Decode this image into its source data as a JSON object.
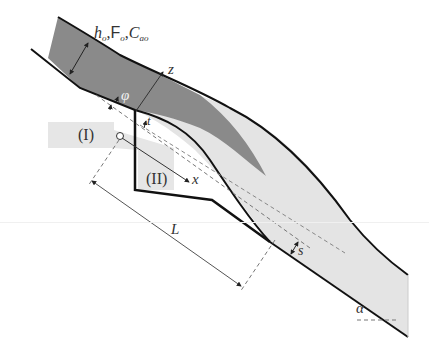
{
  "figure": {
    "type": "ski-jump spillway / aerator flow schematic",
    "colors": {
      "dark_core": "#8a8a8a",
      "light_flow": "#e4e4e4",
      "region_box": "#e8e8e8",
      "boundary": "#111111",
      "dimension": "#555555"
    }
  },
  "labels": {
    "inflow_h": "h",
    "inflow_h_sub": "o",
    "inflow_sep1": ",",
    "inflow_F": "F",
    "inflow_F_sub": "o",
    "inflow_sep2": ",",
    "inflow_C": "C",
    "inflow_C_sub": "ao",
    "z_axis": "z",
    "x_axis": "x",
    "phi": "φ",
    "t": "t",
    "region_1": "(I)",
    "region_2": "(II)",
    "length": "L",
    "step_s": "s",
    "angle_alpha": "α"
  }
}
